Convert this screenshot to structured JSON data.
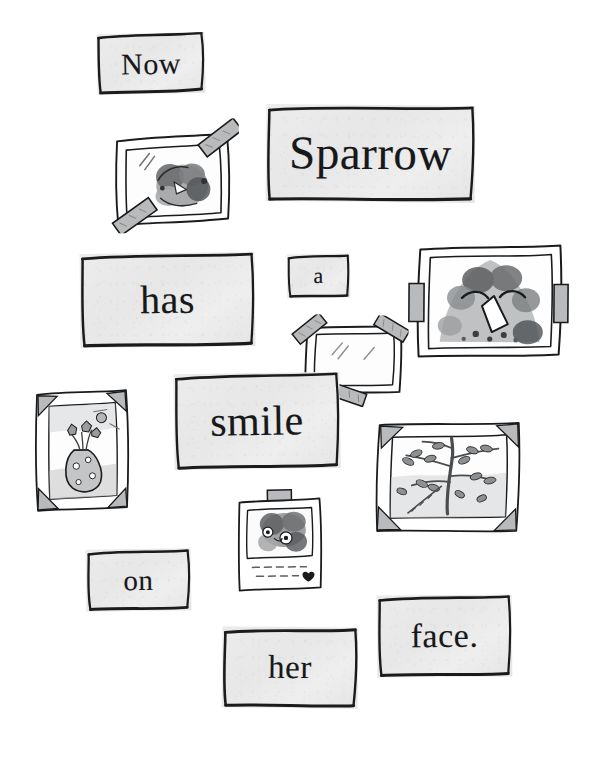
{
  "page": {
    "background_color": "#ffffff",
    "ink_color": "#1a1b1d",
    "card_fill_color": "#ebebec",
    "tape_color": "#b9babb",
    "width": 605,
    "height": 761
  },
  "sentence": {
    "full_text": "Now Sparrow has a smile on her face.",
    "words": [
      {
        "id": "now",
        "text": "Now",
        "font_size": 30,
        "x": 97,
        "y": 33,
        "w": 108,
        "h": 61,
        "rotate": -1.2
      },
      {
        "id": "sparrow",
        "text": "Sparrow",
        "font_size": 47,
        "x": 266,
        "y": 105,
        "w": 209,
        "h": 97,
        "rotate": 0.5
      },
      {
        "id": "has",
        "text": "has",
        "font_size": 40,
        "x": 80,
        "y": 253,
        "w": 175,
        "h": 94,
        "rotate": -0.6
      },
      {
        "id": "a",
        "text": "a",
        "font_size": 22,
        "x": 287,
        "y": 254,
        "w": 63,
        "h": 44,
        "rotate": -0.8
      },
      {
        "id": "smile",
        "text": "smile",
        "font_size": 42,
        "x": 174,
        "y": 373,
        "w": 166,
        "h": 96,
        "rotate": -0.9
      },
      {
        "id": "on",
        "text": "on",
        "font_size": 29,
        "x": 86,
        "y": 549,
        "w": 105,
        "h": 62,
        "rotate": -0.7
      },
      {
        "id": "her",
        "text": "her",
        "font_size": 33,
        "x": 222,
        "y": 627,
        "w": 136,
        "h": 81,
        "rotate": 0.6
      },
      {
        "id": "face.",
        "text": "face.",
        "font_size": 34,
        "x": 377,
        "y": 595,
        "w": 135,
        "h": 82,
        "rotate": -0.5
      }
    ]
  },
  "photos": [
    {
      "id": "taped-bird-photo",
      "subject": "bird-perched-drawing",
      "caption": "",
      "x": 107,
      "y": 128,
      "w": 124,
      "h": 96,
      "rotate": -1.5,
      "mount": "diagonal-tape",
      "tape_count": 2
    },
    {
      "id": "bird-face-photo",
      "subject": "bird-face-closeup-drawing",
      "caption": "",
      "x": 414,
      "y": 246,
      "w": 148,
      "h": 108,
      "rotate": 0.4,
      "mount": "side-tape-tabs",
      "tape_count": 2
    },
    {
      "id": "empty-frame",
      "subject": "blank-frame",
      "caption": "",
      "x": 303,
      "y": 325,
      "w": 90,
      "h": 68,
      "rotate": 1.0,
      "mount": "diagonal-tape",
      "tape_count": 3
    },
    {
      "id": "vase-photo",
      "subject": "flower-vase-drawing",
      "caption": "",
      "x": 32,
      "y": 390,
      "w": 96,
      "h": 117,
      "rotate": -1.0,
      "mount": "photo-corners",
      "tape_count": 4
    },
    {
      "id": "tree-photo",
      "subject": "leafy-branch-drawing",
      "caption": "",
      "x": 375,
      "y": 421,
      "w": 146,
      "h": 109,
      "rotate": 0.8,
      "mount": "photo-corners",
      "tape_count": 4
    },
    {
      "id": "polaroid-photo",
      "subject": "bird-polaroid-drawing",
      "caption": "dashed-caption-lines",
      "x": 237,
      "y": 496,
      "w": 86,
      "h": 91,
      "rotate": -0.8,
      "mount": "single-tape-tab",
      "tape_count": 1
    }
  ]
}
